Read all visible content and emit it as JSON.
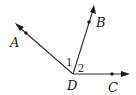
{
  "diagram": {
    "type": "geometry-angles",
    "vertex": {
      "label": "D",
      "x": 73,
      "y": 74
    },
    "rays": [
      {
        "name": "DA",
        "end": {
          "x": 16,
          "y": 24
        },
        "point": {
          "label": "A",
          "x": 26,
          "y": 33
        },
        "label_pos": {
          "x": 10,
          "y": 47
        }
      },
      {
        "name": "DB",
        "end": {
          "x": 94,
          "y": 6
        },
        "point": {
          "label": "B",
          "x": 89,
          "y": 22
        },
        "label_pos": {
          "x": 96,
          "y": 27
        }
      },
      {
        "name": "DC",
        "end": {
          "x": 129,
          "y": 74
        },
        "point": {
          "label": "C",
          "x": 112,
          "y": 74
        },
        "label_pos": {
          "x": 108,
          "y": 92
        }
      }
    ],
    "angle_labels": [
      {
        "text": "1",
        "x": 66,
        "y": 66
      },
      {
        "text": "2",
        "x": 78,
        "y": 72
      }
    ],
    "vertex_label_pos": {
      "x": 67,
      "y": 90
    },
    "colors": {
      "stroke": "#333333",
      "text": "#1a1a1a",
      "background": "#ffffff"
    }
  }
}
